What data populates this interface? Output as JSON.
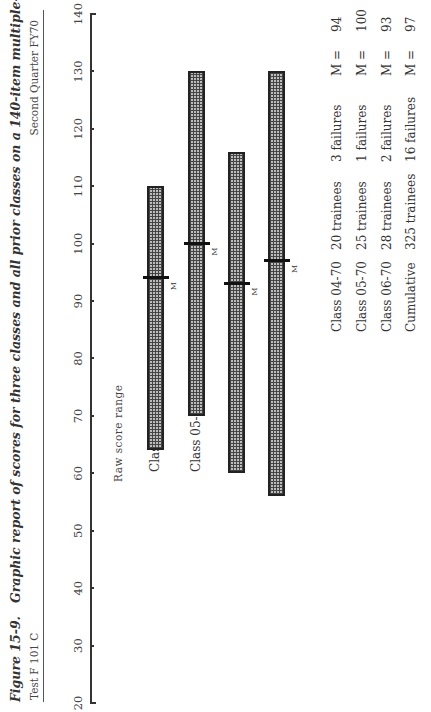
{
  "figure": {
    "number": "Figure 15-9.",
    "caption": "Graphic report of scores for three classes and all prior classes on a 140-item multiple-choice test.",
    "test_id": "Test F 101 C",
    "period": "Second Quarter FY70"
  },
  "axis": {
    "title": "Raw score range",
    "ticks": [
      "20",
      "30",
      "40",
      "50",
      "60",
      "70",
      "80",
      "90",
      "100",
      "110",
      "120",
      "130",
      "140"
    ]
  },
  "rows": [
    {
      "label": "Class  04-70",
      "min": 64,
      "max": 110,
      "mean": 94,
      "mean_label": "M"
    },
    {
      "label": "Class  05-70",
      "min": 70,
      "max": 130,
      "mean": 100,
      "mean_label": "M"
    },
    {
      "label": "Class  06-70",
      "min": 60,
      "max": 116,
      "mean": 93,
      "mean_label": "M"
    },
    {
      "label": "Cumulative",
      "min": 56,
      "max": 130,
      "mean": 97,
      "mean_label": "M"
    }
  ],
  "legend": [
    {
      "name": "Class  04-70",
      "trainees": "20  trainees",
      "failures": "3  failures",
      "m": "M  =",
      "mval": "94"
    },
    {
      "name": "Class  05-70",
      "trainees": "25  trainees",
      "failures": "1  failures",
      "m": "M  =",
      "mval": "100"
    },
    {
      "name": "Class  06-70",
      "trainees": "28  trainees",
      "failures": "2  failures",
      "m": "M  =",
      "mval": "93"
    },
    {
      "name": "Cumulative",
      "trainees": "325  trainees",
      "failures": "16  failures",
      "m": "M  =",
      "mval": "97"
    }
  ],
  "chart_data": {
    "type": "bar",
    "orientation": "horizontal-range (rotated page)",
    "title": "Graphic report of scores for three classes and all prior classes on a 140-item multiple-choice test.",
    "xlabel": "Raw score range",
    "ylabel": "",
    "xlim": [
      20,
      140
    ],
    "categories": [
      "Class 04-70",
      "Class 05-70",
      "Class 06-70",
      "Cumulative"
    ],
    "series": [
      {
        "name": "min score",
        "values": [
          64,
          70,
          60,
          56
        ]
      },
      {
        "name": "max score",
        "values": [
          110,
          130,
          116,
          130
        ]
      },
      {
        "name": "mean (M)",
        "values": [
          94,
          100,
          93,
          97
        ]
      },
      {
        "name": "trainees",
        "values": [
          20,
          25,
          28,
          325
        ]
      },
      {
        "name": "failures",
        "values": [
          3,
          1,
          2,
          16
        ]
      }
    ],
    "grid": false,
    "legend_position": "bottom-right text table"
  }
}
